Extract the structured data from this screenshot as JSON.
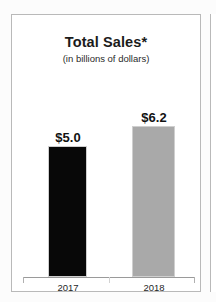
{
  "chart_data": {
    "type": "bar",
    "title": "Total Sales*",
    "subtitle": "(in billions of dollars)",
    "xlabel": "",
    "ylabel": "",
    "categories": [
      "2017",
      "2018"
    ],
    "values": [
      5.0,
      6.2
    ],
    "value_labels": [
      "$5.0",
      "$6.2"
    ],
    "series": [
      {
        "name": "Total Sales",
        "values": [
          5.0,
          6.2
        ],
        "colors": [
          "#080808",
          "#a9a9a9"
        ]
      }
    ],
    "ylim": [
      0,
      7.0
    ],
    "grid": false,
    "legend": "none",
    "axis_ticks": [
      "left",
      "center",
      "right"
    ],
    "units": "billions of dollars"
  },
  "panel": {
    "border_color": "#b9b9b9",
    "background": "#ffffff"
  },
  "bars": [
    {
      "category": "2017",
      "value_label": "$5.0",
      "fill": "#080808"
    },
    {
      "category": "2018",
      "value_label": "$6.2",
      "fill": "#a9a9a9"
    }
  ]
}
